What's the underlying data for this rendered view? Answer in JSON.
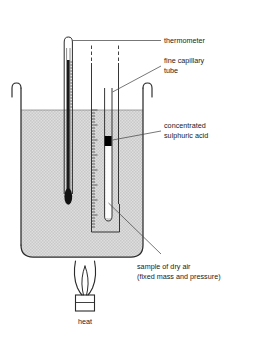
{
  "diagram": {
    "colors": {
      "ink": "#2b2b2b",
      "leader": "#4a4a4a",
      "water_fill": "#d9d9d9",
      "water_fill_dot": "#bdbdbd",
      "acid_index": "#000000",
      "mercury": "#1a1a1a",
      "background": "#ffffff"
    },
    "labels": [
      {
        "id": "thermometer",
        "text": "thermometer",
        "lines": [
          "thermometer"
        ]
      },
      {
        "id": "fine-capillary-tube",
        "text": "fine capillary tube",
        "lines": [
          "fine capillary",
          "tube"
        ]
      },
      {
        "id": "concentrated-sulphuric-acid",
        "text": "concentrated sulphuric acid",
        "lines": [
          "concentrated",
          "sulphuric acid"
        ]
      },
      {
        "id": "sample-of-dry-air",
        "text": "sample of dry air (fixed mass and pressure)",
        "lines": [
          "sample of dry air",
          "(fixed mass and pressure)"
        ]
      },
      {
        "id": "heat",
        "text": "heat",
        "lines": [
          "heat"
        ]
      }
    ],
    "parts": {
      "beaker": "beaker-of-water",
      "water": "water-bath",
      "thermometer": "mercury-thermometer",
      "scale": "graduated-scale-ruler",
      "capillary": "fine-capillary-tube",
      "acid_index": "concentrated-sulphuric-acid-index",
      "gas_column": "trapped-dry-air-column",
      "burner": "bunsen-burner",
      "flame": "flame"
    }
  }
}
